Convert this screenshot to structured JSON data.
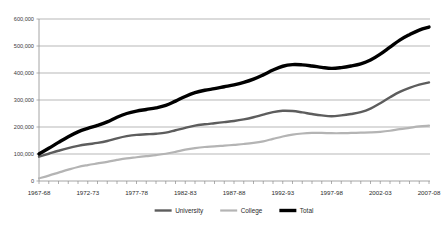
{
  "chart_data": {
    "type": "line",
    "title": "",
    "xlabel": "",
    "ylabel": "",
    "ylim": [
      0,
      600000
    ],
    "grid": true,
    "legend_position": "bottom",
    "x": [
      "1967-68",
      "1968-69",
      "1969-70",
      "1970-71",
      "1971-72",
      "1972-73",
      "1973-74",
      "1974-75",
      "1975-76",
      "1976-77",
      "1977-78",
      "1978-79",
      "1979-80",
      "1980-81",
      "1981-82",
      "1982-83",
      "1983-84",
      "1984-85",
      "1985-86",
      "1986-87",
      "1987-88",
      "1988-89",
      "1989-90",
      "1990-91",
      "1991-92",
      "1992-93",
      "1993-94",
      "1994-95",
      "1995-96",
      "1996-97",
      "1997-98",
      "1998-99",
      "1999-00",
      "2000-01",
      "2001-02",
      "2002-03",
      "2003-04",
      "2004-05",
      "2005-06",
      "2006-07",
      "2007-08"
    ],
    "xtick_labels": [
      "1967-68",
      "1972-73",
      "1977-78",
      "1982-83",
      "1987-88",
      "1992-93",
      "1997-98",
      "2002-03",
      "2007-08"
    ],
    "ytick_labels": [
      "0",
      "100,000",
      "200,000",
      "300,000",
      "400,000",
      "500,000",
      "600,000"
    ],
    "ytick_values": [
      0,
      100000,
      200000,
      300000,
      400000,
      500000,
      600000
    ],
    "series": [
      {
        "name": "University",
        "color": "#5d5d5d",
        "width": 2.4,
        "values": [
          90000,
          101000,
          112000,
          122000,
          130000,
          136000,
          141000,
          148000,
          158000,
          166000,
          171000,
          173000,
          175000,
          179000,
          188000,
          197000,
          205000,
          210000,
          214000,
          218000,
          222000,
          228000,
          236000,
          246000,
          255000,
          260000,
          259000,
          254000,
          248000,
          243000,
          240000,
          243000,
          248000,
          255000,
          268000,
          288000,
          310000,
          330000,
          345000,
          357000,
          365000
        ]
      },
      {
        "name": "College",
        "color": "#b4b4b4",
        "width": 2.2,
        "values": [
          10000,
          20000,
          31000,
          42000,
          52000,
          59000,
          65000,
          71000,
          78000,
          84000,
          88000,
          92000,
          96000,
          101000,
          108000,
          116000,
          122000,
          126000,
          128000,
          131000,
          134000,
          137000,
          141000,
          147000,
          156000,
          165000,
          172000,
          176000,
          178000,
          178000,
          177000,
          177000,
          178000,
          179000,
          180000,
          182000,
          186000,
          192000,
          197000,
          202000,
          205000
        ]
      },
      {
        "name": "Total",
        "color": "#000000",
        "width": 3.4,
        "values": [
          100000,
          121000,
          143000,
          164000,
          182000,
          195000,
          206000,
          219000,
          236000,
          250000,
          259000,
          265000,
          271000,
          280000,
          296000,
          313000,
          327000,
          336000,
          342000,
          349000,
          356000,
          365000,
          377000,
          393000,
          411000,
          425000,
          431000,
          430000,
          426000,
          421000,
          417000,
          420000,
          426000,
          434000,
          448000,
          470000,
          496000,
          522000,
          542000,
          559000,
          570000
        ]
      }
    ]
  },
  "legend": {
    "items": [
      {
        "label": "University"
      },
      {
        "label": "College"
      },
      {
        "label": "Total"
      }
    ]
  },
  "colors": {
    "gridline": "#9a9a9a",
    "axis": "#8d8d8d",
    "text": "#2b2b2b",
    "background": "#ffffff"
  }
}
